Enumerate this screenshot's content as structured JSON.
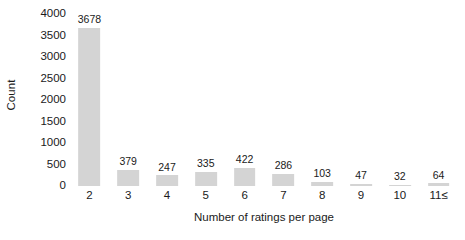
{
  "chart_data": {
    "type": "bar",
    "title": "",
    "subtitle": "",
    "xlabel": "Number of ratings per page",
    "ylabel": "Count",
    "categories": [
      "2",
      "3",
      "4",
      "5",
      "6",
      "7",
      "8",
      "9",
      "10",
      "11≤"
    ],
    "values": [
      3678,
      379,
      247,
      335,
      422,
      286,
      103,
      47,
      32,
      64
    ],
    "value_labels": [
      "3678",
      "379",
      "247",
      "335",
      "422",
      "286",
      "103",
      "47",
      "32",
      "64"
    ],
    "ylim": [
      0,
      4000
    ],
    "ytick_values": [
      0,
      500,
      1000,
      1500,
      2000,
      2500,
      3000,
      3500,
      4000
    ],
    "ytick_labels": [
      "0",
      "500",
      "1000",
      "1500",
      "2000",
      "2500",
      "3000",
      "3500",
      "4000"
    ],
    "grid": false,
    "legend": false,
    "legend_position": "none",
    "bar_color": "#d4d4d4",
    "background_color": "#ffffff",
    "text_color": "#1a1a1a"
  }
}
